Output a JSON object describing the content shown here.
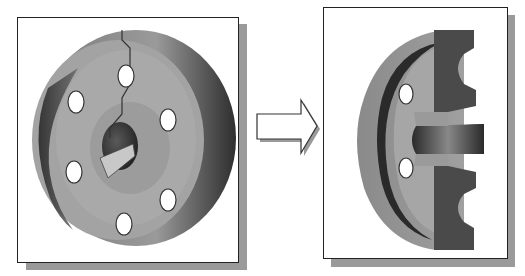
{
  "figure": {
    "caption_fragment": "",
    "left_panel": {
      "label": "Full part",
      "description": "Solid flange with six bolt holes and keyed central bore, showing section cut line"
    },
    "arrow": {
      "direction": "right",
      "meaning": "transforms to"
    },
    "right_panel": {
      "label": "Section view",
      "description": "Half-section of flange revealing cross-section profile"
    }
  },
  "colors": {
    "frame_border": "#222222",
    "shadow": "#9a9a9a",
    "part_light": "#a8a8a8",
    "part_mid": "#8c8c8c",
    "part_dark": "#3a3a3a",
    "section_face": "#555555",
    "hole": "#ffffff"
  }
}
